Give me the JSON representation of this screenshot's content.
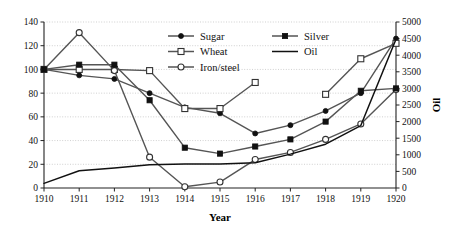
{
  "chart_data": {
    "type": "line",
    "title": "",
    "xlabel": "Year",
    "ylabel": "",
    "y2label": "Oil",
    "x": [
      1910,
      1911,
      1912,
      1913,
      1914,
      1915,
      1916,
      1917,
      1918,
      1919,
      1920
    ],
    "xlim": [
      1910,
      1920
    ],
    "ylim": [
      0,
      140
    ],
    "y2lim": [
      0,
      5000
    ],
    "yticks": [
      0,
      20,
      40,
      60,
      80,
      100,
      120,
      140
    ],
    "y2ticks": [
      0,
      500,
      1000,
      1500,
      2000,
      2500,
      3000,
      3500,
      4000,
      4500,
      5000
    ],
    "xticks": [
      1910,
      1911,
      1912,
      1913,
      1914,
      1915,
      1916,
      1917,
      1918,
      1919,
      1920
    ],
    "grid": true,
    "legend_position": "top-right",
    "series": [
      {
        "name": "Sugar",
        "marker": "filled-circle",
        "axis": "left",
        "values": [
          100,
          95,
          92,
          80,
          68,
          63,
          46,
          53,
          65,
          80,
          126
        ]
      },
      {
        "name": "Wheat",
        "marker": "open-square",
        "axis": "left",
        "values": [
          100,
          100,
          100,
          99,
          67,
          67,
          89,
          null,
          79,
          109,
          122
        ]
      },
      {
        "name": "Iron/steel",
        "marker": "open-circle",
        "axis": "left",
        "values": [
          100,
          131,
          99,
          26,
          1,
          5,
          24,
          30,
          41,
          54,
          83
        ]
      },
      {
        "name": "Silver",
        "marker": "filled-square",
        "axis": "left",
        "values": [
          100,
          104,
          104,
          74,
          34,
          29,
          35,
          41,
          56,
          82,
          84
        ]
      },
      {
        "name": "Oil",
        "marker": "none",
        "axis": "right",
        "values": [
          140,
          520,
          600,
          700,
          720,
          720,
          760,
          1020,
          1320,
          1880,
          4480
        ]
      }
    ]
  },
  "legend": {
    "entries": [
      {
        "label": "Sugar",
        "marker": "filled-circle"
      },
      {
        "label": "Silver",
        "marker": "filled-square"
      },
      {
        "label": "Wheat",
        "marker": "open-square"
      },
      {
        "label": "Oil",
        "marker": "none"
      },
      {
        "label": "Iron/steel",
        "marker": "open-circle"
      }
    ]
  },
  "colors": {
    "line": "#555555",
    "oil_line": "#111111",
    "marker_fill": "#111111",
    "marker_open_fill": "#ffffff",
    "grid": "#bbbbbb",
    "axis": "#222222",
    "text": "#111111",
    "background": "#ffffff"
  },
  "labels": {
    "y_axis_ticks": [
      "0",
      "20",
      "40",
      "60",
      "80",
      "100",
      "120",
      "140"
    ],
    "y2_axis_ticks": [
      "0",
      "500",
      "1000",
      "1500",
      "2000",
      "2500",
      "3000",
      "3500",
      "4000",
      "4500",
      "5000"
    ],
    "x_axis_ticks": [
      "1910",
      "1911",
      "1912",
      "1913",
      "1914",
      "1915",
      "1916",
      "1917",
      "1918",
      "1919",
      "1920"
    ],
    "x_axis_title": "Year",
    "y2_axis_title": "Oil"
  }
}
